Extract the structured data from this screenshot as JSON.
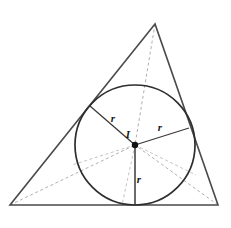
{
  "figure": {
    "background_color": "#ffffff",
    "stroke_color": "#3a3a3a",
    "dash_color": "#b0b0b0",
    "label_color": "#1a1a1a",
    "triangle": {
      "name": "outer-triangle",
      "vertices": [
        {
          "name": "apex",
          "x": 155,
          "y": 24
        },
        {
          "name": "bottom-left",
          "x": 10,
          "y": 205
        },
        {
          "name": "bottom-right",
          "x": 218,
          "y": 205
        }
      ]
    },
    "incircle": {
      "name": "incircle",
      "center_x": 135,
      "center_y": 145,
      "radius": 60
    },
    "incenter": {
      "name": "incenter-point",
      "x": 135,
      "y": 145,
      "dot_radius": 3.2
    },
    "radii": [
      {
        "name": "radius-to-left-side",
        "x1": 135,
        "y1": 145,
        "x2": 90,
        "y2": 106,
        "label": "r",
        "label_x": 113,
        "label_y": 122
      },
      {
        "name": "radius-to-right-side",
        "x1": 135,
        "y1": 145,
        "x2": 189,
        "y2": 128,
        "label": "r",
        "label_x": 160,
        "label_y": 131
      },
      {
        "name": "radius-to-base",
        "x1": 135,
        "y1": 145,
        "x2": 135,
        "y2": 205,
        "label": "r",
        "label_x": 139,
        "label_y": 183
      }
    ],
    "bisectors": [
      {
        "name": "bisector-from-apex",
        "x1": 155,
        "y1": 24,
        "x2": 135,
        "y2": 145
      },
      {
        "name": "bisector-from-bottom-left",
        "x1": 10,
        "y1": 205,
        "x2": 135,
        "y2": 145
      },
      {
        "name": "bisector-from-bottom-right",
        "x1": 218,
        "y1": 205,
        "x2": 135,
        "y2": 145
      }
    ],
    "bisector_extensions": [
      {
        "name": "bisector-extension-to-base",
        "x1": 135,
        "y1": 145,
        "x2": 122,
        "y2": 205
      },
      {
        "name": "bisector-extension-to-right-side",
        "x1": 135,
        "y1": 145,
        "x2": 196,
        "y2": 175
      },
      {
        "name": "bisector-extension-to-left-side",
        "x1": 135,
        "y1": 145,
        "x2": 72,
        "y2": 165
      }
    ],
    "labels": {
      "incenter_label": "I",
      "incenter_label_x": 128,
      "incenter_label_y": 138,
      "radius_label": "r"
    }
  }
}
